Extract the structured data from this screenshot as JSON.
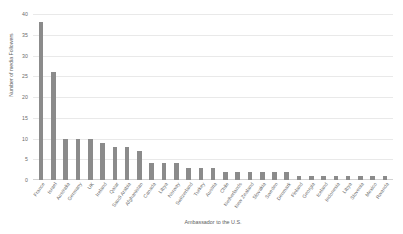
{
  "chart_data": {
    "type": "bar",
    "title": "",
    "xlabel": "Ambassador to the U.S.",
    "ylabel": "Number of media Followers",
    "ylim": [
      0,
      40
    ],
    "ytick_step": 5,
    "yticks": [
      "0",
      "5",
      "10",
      "15",
      "20",
      "25",
      "30",
      "35",
      "40"
    ],
    "grid": true,
    "legend": "none",
    "bar_color": "#8b8b8b",
    "grid_color": "#e9e9e9",
    "axis_color": "#d2d2d2",
    "text_color": "#6b6b6b",
    "categories": [
      "France",
      "Israel",
      "Australia",
      "Germany",
      "UK",
      "Ireland",
      "Qatar",
      "Saudi Arabia",
      "Afghanistan",
      "Canada",
      "Libya",
      "Norway",
      "Switzerland",
      "Turkey",
      "Austria",
      "Chile",
      "Netherlands",
      "New Zealand",
      "Slovakia",
      "Sweden",
      "Denmark",
      "Finland",
      "Georgia",
      "Iceland",
      "Indonesia",
      "Libya",
      "Slovenia",
      "Mexico",
      "Rwanda"
    ],
    "values": [
      38,
      26,
      10,
      10,
      10,
      9,
      8,
      8,
      7,
      4,
      4,
      4,
      3,
      3,
      3,
      2,
      2,
      2,
      2,
      2,
      2,
      1,
      1,
      1,
      1,
      1,
      1,
      1,
      1
    ]
  }
}
